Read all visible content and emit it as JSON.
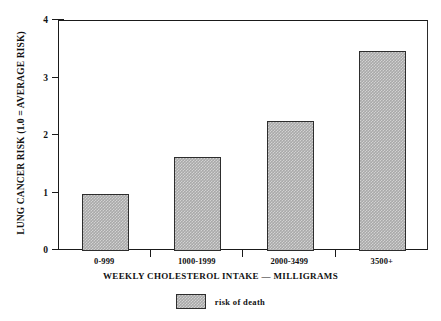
{
  "chart_data": {
    "type": "bar",
    "title": "",
    "xlabel": "WEEKLY CHOLESTEROL INTAKE — MILLIGRAMS",
    "ylabel": "LUNG CANCER RISK (1.0 = AVERAGE RISK)",
    "categories": [
      "0-999",
      "1000-1999",
      "2000-3499",
      "3500+"
    ],
    "values": [
      1.0,
      1.63,
      2.26,
      3.48
    ],
    "series": [
      {
        "name": "risk of death",
        "values": [
          1.0,
          1.63,
          2.26,
          3.48
        ]
      }
    ],
    "ylim": [
      0,
      4
    ],
    "yticks": [
      0,
      1,
      2,
      3,
      4
    ],
    "ytick_labels": [
      "0",
      "1",
      "2",
      "3",
      "4"
    ],
    "grid": false,
    "legend": {
      "position": "bottom-center",
      "entries": [
        {
          "label": "risk of death",
          "color": "#a9a9a9",
          "pattern": "dithered-gray"
        }
      ]
    },
    "colors": {
      "bar_fill": "#a9a9a9",
      "bar_edge": "#2d2d2d",
      "axis": "#1a1a1a",
      "background": "#ffffff",
      "text": "#111111"
    }
  }
}
